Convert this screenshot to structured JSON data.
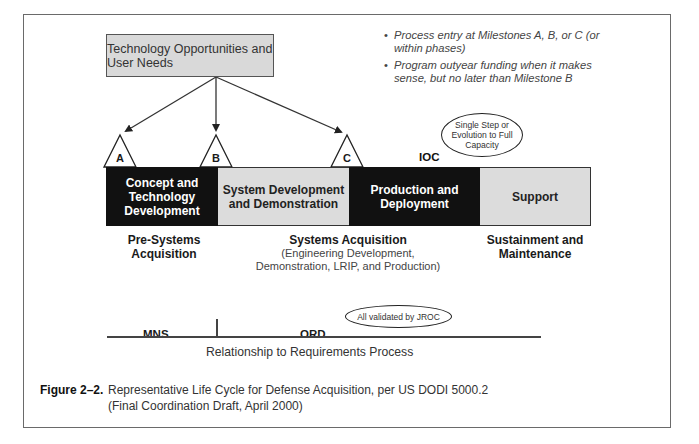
{
  "diagram": {
    "top_box": {
      "label": "Technology Opportunities and User Needs"
    },
    "notes": [
      {
        "bullet": "•",
        "text": "Process entry at Milestones A, B, or C (or within phases)"
      },
      {
        "bullet": "•",
        "text": "Program outyear funding when it makes sense, but no later than Milestone B"
      }
    ],
    "milestones": [
      {
        "id": "A",
        "label": "A"
      },
      {
        "id": "B",
        "label": "B"
      },
      {
        "id": "C",
        "label": "C"
      }
    ],
    "evolution_oval": {
      "label": "Single Step or Evolution to Full Capacity"
    },
    "ioc_label": "IOC",
    "phases": [
      {
        "label": "Concept and Technology Development",
        "style": "dark"
      },
      {
        "label": "System Development and Demonstration",
        "style": "light"
      },
      {
        "label": "Production and Deployment",
        "style": "dark"
      },
      {
        "label": "Support",
        "style": "light"
      }
    ],
    "groupings": [
      {
        "title": "Pre-Systems Acquisition",
        "subtitle": ""
      },
      {
        "title": "Systems Acquisition",
        "subtitle": "(Engineering Development, Demonstration, LRIP, and Production)"
      },
      {
        "title": "Sustainment and Maintenance",
        "subtitle": ""
      }
    ],
    "requirements": {
      "left_label": "MNS",
      "right_label": "ORD",
      "validation_oval": "All validated by JROC",
      "caption": "Relationship to Requirements Process"
    },
    "colors": {
      "dark_phase": "#111111",
      "light_phase": "#dcdcdc",
      "top_box_fill": "#d9d9d9"
    }
  },
  "figure_caption": {
    "number": "Figure 2–2.",
    "line1": "Representative Life Cycle for Defense Acquisition, per US DODI 5000.2",
    "line2": "(Final Coordination Draft, April 2000)"
  }
}
